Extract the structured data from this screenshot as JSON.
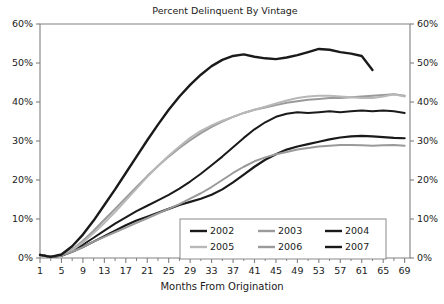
{
  "chart_data": {
    "type": "line",
    "title": "Percent Delinquent By Vintage",
    "xlabel": "Months From Origination",
    "ylabel": "",
    "xlim": [
      1,
      70
    ],
    "ylim": [
      0,
      60
    ],
    "grid": false,
    "legend_position": "bottom-center",
    "y_tick_labels": [
      "0%",
      "10%",
      "20%",
      "30%",
      "40%",
      "50%",
      "60%"
    ],
    "y_tick_values": [
      0,
      10,
      20,
      30,
      40,
      50,
      60
    ],
    "y_axis_right_mirrored": true,
    "x_tick_labels": [
      "1",
      "5",
      "9",
      "13",
      "17",
      "21",
      "25",
      "29",
      "33",
      "37",
      "41",
      "45",
      "49",
      "53",
      "57",
      "61",
      "65",
      "69"
    ],
    "x_tick_values": [
      1,
      5,
      9,
      13,
      17,
      21,
      25,
      29,
      33,
      37,
      41,
      45,
      49,
      53,
      57,
      61,
      65,
      69
    ],
    "x_minor_tick_step": 2,
    "x": [
      1,
      3,
      5,
      7,
      9,
      11,
      13,
      15,
      17,
      19,
      21,
      23,
      25,
      27,
      29,
      31,
      33,
      35,
      37,
      39,
      41,
      43,
      45,
      47,
      49,
      51,
      53,
      55,
      57,
      59,
      61,
      63,
      65,
      67,
      69
    ],
    "series": [
      {
        "name": "2002",
        "color": "#1a1a1a",
        "width": 2.2,
        "values": [
          0.8,
          0.3,
          0.6,
          1.6,
          2.8,
          4.2,
          5.6,
          7.0,
          8.4,
          9.6,
          10.6,
          11.6,
          12.6,
          13.6,
          14.4,
          15.2,
          16.2,
          17.6,
          19.4,
          21.4,
          23.4,
          25.2,
          26.6,
          27.8,
          28.6,
          29.2,
          29.8,
          30.4,
          30.9,
          31.2,
          31.3,
          31.2,
          31.0,
          30.8,
          30.7
        ]
      },
      {
        "name": "2003",
        "color": "#9a9a9a",
        "width": 2.0,
        "values": [
          0.8,
          0.3,
          0.7,
          2.2,
          4.4,
          7.0,
          9.8,
          12.6,
          15.4,
          18.2,
          21.0,
          23.6,
          26.0,
          28.2,
          30.2,
          32.0,
          33.6,
          35.0,
          36.2,
          37.2,
          38.0,
          38.6,
          39.2,
          39.8,
          40.2,
          40.6,
          40.8,
          41.0,
          41.0,
          41.2,
          41.4,
          41.6,
          41.8,
          42.0,
          41.6
        ]
      },
      {
        "name": "2004",
        "color": "#1a1a1a",
        "width": 2.0,
        "values": [
          0.8,
          0.3,
          0.6,
          1.8,
          3.4,
          5.2,
          7.0,
          8.8,
          10.4,
          12.0,
          13.4,
          14.8,
          16.2,
          17.8,
          19.6,
          21.6,
          23.8,
          26.0,
          28.4,
          30.8,
          33.0,
          34.8,
          36.2,
          37.0,
          37.4,
          37.2,
          37.4,
          37.6,
          37.4,
          37.6,
          37.8,
          37.6,
          37.8,
          37.6,
          37.2
        ]
      },
      {
        "name": "2005",
        "color": "#b8b8b8",
        "width": 2.0,
        "values": [
          0.8,
          0.3,
          0.7,
          2.0,
          4.0,
          6.4,
          9.0,
          11.8,
          14.8,
          17.8,
          20.8,
          23.6,
          26.2,
          28.6,
          30.8,
          32.6,
          34.0,
          35.2,
          36.2,
          37.2,
          38.0,
          38.8,
          39.6,
          40.4,
          41.0,
          41.4,
          41.6,
          41.6,
          41.4,
          41.2,
          41.0,
          41.0,
          41.4,
          42.0,
          41.4
        ]
      },
      {
        "name": "2006",
        "color": "#9a9a9a",
        "width": 2.0,
        "values": [
          0.8,
          0.3,
          0.6,
          1.6,
          2.8,
          4.2,
          5.4,
          6.6,
          7.8,
          9.0,
          10.2,
          11.4,
          12.6,
          13.8,
          15.2,
          16.6,
          18.2,
          20.0,
          21.8,
          23.4,
          24.8,
          25.8,
          26.6,
          27.2,
          27.8,
          28.2,
          28.6,
          28.8,
          29.0,
          29.0,
          28.9,
          28.8,
          28.9,
          29.0,
          28.8
        ]
      },
      {
        "name": "2007",
        "color": "#1a1a1a",
        "width": 2.4,
        "values": [
          0.8,
          0.3,
          0.9,
          3.0,
          6.0,
          9.6,
          13.6,
          17.6,
          21.8,
          26.0,
          30.2,
          34.2,
          38.0,
          41.4,
          44.4,
          47.0,
          49.2,
          50.8,
          51.8,
          52.2,
          51.6,
          51.2,
          51.0,
          51.4,
          52.0,
          52.8,
          53.6,
          53.4,
          52.8,
          52.4,
          51.8,
          48.2,
          null,
          null,
          null
        ]
      }
    ]
  },
  "legend": {
    "entries": [
      {
        "label": "2002"
      },
      {
        "label": "2003"
      },
      {
        "label": "2004"
      },
      {
        "label": "2005"
      },
      {
        "label": "2006"
      },
      {
        "label": "2007"
      }
    ]
  }
}
